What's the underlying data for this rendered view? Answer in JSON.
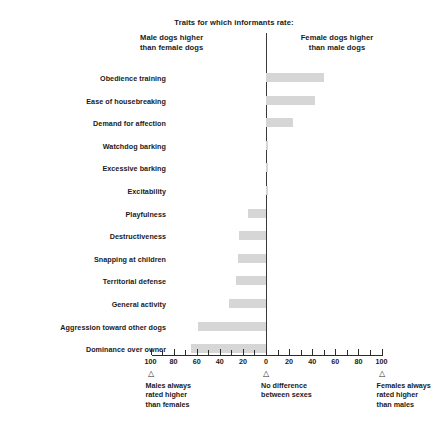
{
  "header": {
    "title": "Traits for which informants rate:",
    "left_col_line1": "Male dogs higher",
    "left_col_line2": "than female dogs",
    "right_col_line1": "Female dogs higher",
    "right_col_line2": "than male dogs"
  },
  "axis": {
    "tick_labels": [
      "100",
      "80",
      "60",
      "40",
      "20",
      "0",
      "20",
      "40",
      "60",
      "80",
      "100"
    ],
    "marker_glyph": "△"
  },
  "footnotes": [
    {
      "line1": "Males always",
      "line2": "rated higher",
      "line3": "than females"
    },
    {
      "line1": "No difference",
      "line2": "between sexes",
      "line3": ""
    },
    {
      "line1": "Females always",
      "line2": "rated higher",
      "line3": "than males"
    }
  ],
  "colors": {
    "bar": "#d6d6d6",
    "axis": "#2b2b2b",
    "zero_line": "#3a3a3a",
    "text": "#1a1a1a"
  },
  "chart_data": {
    "type": "bar",
    "orientation": "horizontal",
    "title": "Traits for which informants rate:",
    "subtitle_left": "Male dogs higher than female dogs",
    "subtitle_right": "Female dogs higher than male dogs",
    "xlabel": "",
    "ylabel": "",
    "xlim": [
      -100,
      100
    ],
    "xticks": [
      -100,
      -80,
      -60,
      -40,
      -20,
      0,
      20,
      40,
      60,
      80,
      100
    ],
    "xtick_labels": [
      "100",
      "80",
      "60",
      "40",
      "20",
      "0",
      "20",
      "40",
      "60",
      "80",
      "100"
    ],
    "grid": false,
    "legend": "none",
    "note": "Negative values extend left (males rated higher); positive values extend right (females rated higher).",
    "categories": [
      "Obedience training",
      "Ease of housebreaking",
      "Demand for affection",
      "Watchdog barking",
      "Excessive barking",
      "Excitability",
      "Playfulness",
      "Destructiveness",
      "Snapping at children",
      "Territorial defense",
      "General activity",
      "Aggression toward other dogs",
      "Dominance over owner"
    ],
    "values": [
      50,
      42,
      23,
      1,
      1,
      1,
      -16,
      -23,
      -24,
      -26,
      -32,
      -59,
      -65
    ]
  }
}
